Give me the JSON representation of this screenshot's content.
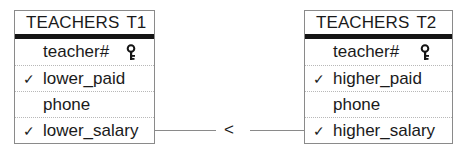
{
  "entities": [
    {
      "name": "TEACHERS",
      "alias": "T1",
      "fields": [
        {
          "label": "teacher#",
          "checked": false,
          "key": true,
          "check_glyph": ""
        },
        {
          "label": "lower_paid",
          "checked": true,
          "key": false,
          "check_glyph": "✓"
        },
        {
          "label": "phone",
          "checked": false,
          "key": false,
          "check_glyph": ""
        },
        {
          "label": "lower_salary",
          "checked": true,
          "key": false,
          "check_glyph": "✓"
        }
      ]
    },
    {
      "name": "TEACHERS",
      "alias": "T2",
      "fields": [
        {
          "label": "teacher#",
          "checked": false,
          "key": true,
          "check_glyph": ""
        },
        {
          "label": "higher_paid",
          "checked": true,
          "key": false,
          "check_glyph": "✓"
        },
        {
          "label": "phone",
          "checked": false,
          "key": false,
          "check_glyph": ""
        },
        {
          "label": "higher_salary",
          "checked": true,
          "key": false,
          "check_glyph": "✓"
        }
      ]
    }
  ],
  "join": {
    "from": "T1.lower_salary",
    "to": "T2.higher_salary",
    "operator": "<"
  },
  "icons": {
    "key": "key-icon",
    "check": "checkmark-icon"
  },
  "colors": {
    "border": "#8a8a8a",
    "header_bar": "#141414",
    "text": "#1a1a1a",
    "row_divider": "#b8b8b8"
  }
}
